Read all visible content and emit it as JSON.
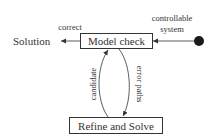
{
  "diagram": {
    "nodes": {
      "model_check": "Model check",
      "refine_solve": "Refine and Solve",
      "solution": "Solution"
    },
    "edges": {
      "correct": "correct",
      "controllable_line1": "controllable",
      "controllable_line2": "system",
      "candidate": "candidate",
      "error_paths": "error paths"
    },
    "colors": {
      "stroke": "#333333",
      "text": "#333333",
      "dot": "#1a1a1a"
    }
  }
}
